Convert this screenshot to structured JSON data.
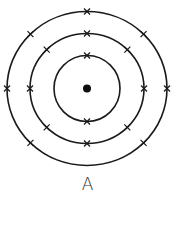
{
  "diagram": {
    "type": "bohr-model",
    "label": "A",
    "center": {
      "x": 87,
      "y": 88.5
    },
    "nucleus": {
      "radius": 4
    },
    "shells": [
      {
        "name": "inner",
        "rx": 33,
        "ry": 33,
        "electron_count": 2,
        "electron_angles_deg": [
          270,
          90
        ]
      },
      {
        "name": "middle",
        "rx": 57,
        "ry": 55,
        "electron_count": 8,
        "electron_angles_deg": [
          270,
          225,
          315,
          180,
          0,
          135,
          90,
          45
        ]
      },
      {
        "name": "outer",
        "rx": 80,
        "ry": 77,
        "electron_count": 7,
        "electron_angles_deg": [
          270,
          225,
          315,
          180,
          0,
          135,
          45
        ]
      }
    ],
    "total_electrons": 17,
    "colors": {
      "stroke": "#1a1a1a",
      "nucleus": "#0d0d0d",
      "label": "#333333",
      "background": "#ffffff"
    }
  }
}
